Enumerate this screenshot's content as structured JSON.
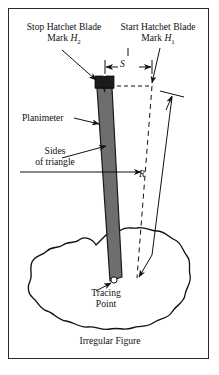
{
  "figure": {
    "caption": "Irregular Figure",
    "labels": {
      "stop_line1": "Stop Hatchet Blade",
      "stop_line2_pre": "Mark ",
      "stop_line2_var": "H",
      "stop_line2_sub": "2",
      "start_line1": "Start Hatchet Blade",
      "start_line2_pre": "Mark ",
      "start_line2_var": "H",
      "start_line2_sub": "1",
      "planimeter": "Planimeter",
      "sides_line1": "Sides",
      "sides_line2": "of triangle",
      "dimension_s": "S",
      "dimension_r": "R",
      "tracing_line1": "Tracing",
      "tracing_line2": "Point"
    },
    "colors": {
      "ink": "#111111",
      "frame": "#2a2a2a",
      "bar_fill": "#6e6e6e",
      "bar_stroke": "#1a1a1a",
      "blade_fill": "#1c1c1c",
      "blob_stroke": "#111111",
      "paper": "#ffffff"
    }
  }
}
